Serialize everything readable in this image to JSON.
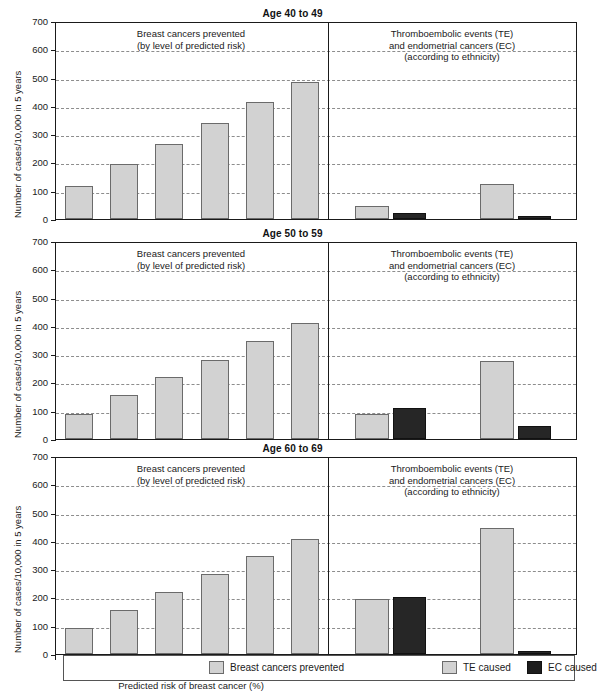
{
  "figure": {
    "ylabel": "Number of cases/10,000 in 5 years",
    "xlabel": "Predicted risk of breast cancer (%)",
    "left_note_line1": "Breast cancers prevented",
    "left_note_line2": "(by level of predicted risk)",
    "right_note_line1": "Thromboembolic events (TE)",
    "right_note_line2": "and endometrial cancers (EC)",
    "right_note_line3": "(according to ethnicity)",
    "yticks": [
      "0",
      "100",
      "200",
      "300",
      "400",
      "500",
      "600",
      "700"
    ],
    "risk_categories": [
      "1.5",
      "2.5",
      "3.5",
      "4.5",
      "5.5",
      "6.5"
    ],
    "ethnicities": [
      "Caucasian",
      "African-American"
    ],
    "colors": {
      "light_fill": "#d2d2d2",
      "light_edge": "#6b6b6b",
      "dark_fill": "#262626",
      "dark_edge": "#111111",
      "axis": "#1a1a1a",
      "grid": "#8d8d8d"
    }
  },
  "legend": {
    "items": [
      {
        "label": "Breast cancers prevented",
        "swatch": "light"
      },
      {
        "label": "TE caused",
        "swatch": "light"
      },
      {
        "label": "EC caused",
        "swatch": "dark"
      }
    ]
  },
  "chart_data": [
    {
      "type": "bar",
      "title": "Age 40 to 49",
      "xlabel": "Predicted risk of breast cancer (%)",
      "ylabel": "Number of cases/10,000 in 5 years",
      "ylim": [
        0,
        700
      ],
      "ytick_step": 100,
      "grid": true,
      "legend_position": "bottom",
      "categories": [
        "1.5",
        "2.5",
        "3.5",
        "4.5",
        "5.5",
        "6.5"
      ],
      "values": [
        115,
        195,
        265,
        340,
        415,
        485
      ],
      "ethnicity_categories": [
        "Caucasian",
        "African-American"
      ],
      "series": [
        {
          "name": "TE caused",
          "values": [
            45,
            125
          ]
        },
        {
          "name": "EC caused",
          "values": [
            20,
            10
          ]
        }
      ]
    },
    {
      "type": "bar",
      "title": "Age 50 to 59",
      "xlabel": "Predicted risk of breast cancer (%)",
      "ylabel": "Number of cases/10,000 in 5 years",
      "ylim": [
        0,
        700
      ],
      "ytick_step": 100,
      "grid": true,
      "legend_position": "bottom",
      "categories": [
        "1.5",
        "2.5",
        "3.5",
        "4.5",
        "5.5",
        "6.5"
      ],
      "values": [
        90,
        155,
        218,
        280,
        347,
        410
      ],
      "ethnicity_categories": [
        "Caucasian",
        "African-American"
      ],
      "series": [
        {
          "name": "TE caused",
          "values": [
            90,
            275
          ]
        },
        {
          "name": "EC caused",
          "values": [
            110,
            45
          ]
        }
      ]
    },
    {
      "type": "bar",
      "title": "Age 60 to 69",
      "xlabel": "Predicted risk of breast cancer (%)",
      "ylabel": "Number of cases/10,000 in 5 years",
      "ylim": [
        0,
        700
      ],
      "ytick_step": 100,
      "grid": true,
      "legend_position": "bottom",
      "categories": [
        "1.5",
        "2.5",
        "3.5",
        "4.5",
        "5.5",
        "6.5"
      ],
      "values": [
        92,
        157,
        218,
        283,
        348,
        408
      ],
      "ethnicity_categories": [
        "Caucasian",
        "African-American"
      ],
      "series": [
        {
          "name": "TE caused",
          "values": [
            195,
            445
          ]
        },
        {
          "name": "EC caused",
          "values": [
            200,
            10
          ]
        }
      ]
    }
  ]
}
